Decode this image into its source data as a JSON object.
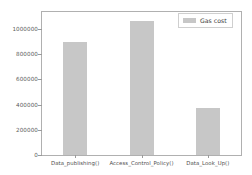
{
  "chart_data": {
    "type": "bar",
    "title": "",
    "xlabel": "",
    "ylabel": "",
    "categories": [
      "Data_publishing()",
      "Access_Control_Policy()",
      "Data_Look_Up()"
    ],
    "series": [
      {
        "name": "Gas cost",
        "values": [
          900000,
          1060000,
          375000
        ],
        "color": "#c7c7c7"
      }
    ],
    "ylim": [
      0,
      1135000
    ],
    "yticks": [
      0,
      200000,
      400000,
      600000,
      800000,
      1000000
    ],
    "ytick_labels": [
      "0",
      "200000",
      "400000",
      "600000",
      "800000",
      "1000000"
    ],
    "grid": false,
    "legend": {
      "position": "upper right",
      "entries": [
        {
          "label": "Gas cost",
          "color": "#c7c7c7"
        }
      ]
    }
  },
  "figure": {
    "background": "#ffffff",
    "axes_edge_color": "#b0b0b0",
    "tick_color": "#9a9a9a",
    "tick_label_color": "#5a5a5a"
  }
}
